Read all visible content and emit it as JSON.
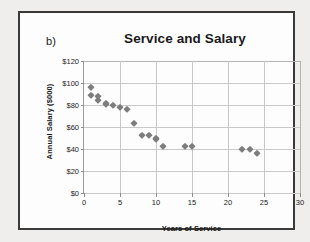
{
  "figure": {
    "panel_letter": "b)",
    "title": "Service and Salary",
    "marker_color": "#7d7d7d",
    "gridline_color": "#c9c9c9",
    "frame_color": "#3a3a3a"
  },
  "chart_data": {
    "type": "scatter",
    "title": "Service and Salary",
    "xlabel": "Years of Service",
    "ylabel": "Annual Salary ($000)",
    "xlim": [
      0,
      30
    ],
    "ylim": [
      0,
      120
    ],
    "xticks": [
      0,
      5,
      10,
      15,
      20,
      25,
      30
    ],
    "xtick_labels": [
      "0",
      "5",
      "10",
      "15",
      "20",
      "25",
      "30"
    ],
    "yticks": [
      0,
      20,
      40,
      60,
      80,
      100,
      120
    ],
    "ytick_labels": [
      "$0",
      "$20",
      "$40",
      "$60",
      "$80",
      "$100",
      "$120"
    ],
    "grid": true,
    "legend": false,
    "series": [
      {
        "name": "Employees",
        "marker": "diamond",
        "color": "#7d7d7d",
        "points": [
          [
            1,
            96
          ],
          [
            1,
            89
          ],
          [
            2,
            88
          ],
          [
            2,
            85
          ],
          [
            3,
            82
          ],
          [
            3,
            81
          ],
          [
            4,
            80
          ],
          [
            5,
            78.5
          ],
          [
            6,
            76
          ],
          [
            7,
            64
          ],
          [
            8,
            53
          ],
          [
            9,
            53
          ],
          [
            10,
            50
          ],
          [
            10,
            49
          ],
          [
            11,
            43
          ],
          [
            14,
            42.5
          ],
          [
            15,
            42.5
          ],
          [
            22,
            40
          ],
          [
            23,
            40
          ],
          [
            24,
            36
          ]
        ]
      }
    ]
  }
}
